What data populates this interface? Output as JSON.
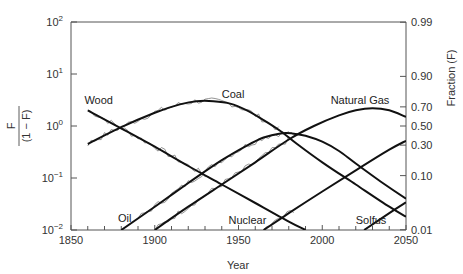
{
  "chart_data": {
    "type": "line",
    "title": "",
    "xlabel": "Year",
    "ylabel_left": "F / (1 − F)",
    "ylabel_right": "Fraction (F)",
    "xlim": [
      1850,
      2050
    ],
    "ylim": [
      0.01,
      100
    ],
    "yscale": "log",
    "grid": false,
    "legend": "inline labels",
    "x_ticks": [
      1850,
      1900,
      1950,
      2000,
      2050
    ],
    "x_minor_step": 10,
    "y_ticks_left": [
      {
        "value": 100,
        "label_base": "10",
        "label_exp": "2"
      },
      {
        "value": 10,
        "label_base": "10",
        "label_exp": "1"
      },
      {
        "value": 1,
        "label_base": "10",
        "label_exp": "0"
      },
      {
        "value": 0.1,
        "label_base": "10",
        "label_exp": "−1"
      },
      {
        "value": 0.01,
        "label_base": "10",
        "label_exp": "−2"
      }
    ],
    "y_ticks_right": [
      {
        "F": 0.99,
        "label": "0.99"
      },
      {
        "F": 0.9,
        "label": "0.90"
      },
      {
        "F": 0.7,
        "label": "0.70"
      },
      {
        "F": 0.5,
        "label": "0.50"
      },
      {
        "F": 0.3,
        "label": "0.30"
      },
      {
        "F": 0.1,
        "label": "0.10"
      },
      {
        "F": 0.01,
        "label": "0.01"
      }
    ],
    "series": [
      {
        "name": "Wood",
        "label": "Wood",
        "label_pos": [
          1858,
          2.6
        ],
        "points": [
          [
            1860,
            2.0
          ],
          [
            1880,
            0.9
          ],
          [
            1900,
            0.4
          ],
          [
            1920,
            0.17
          ],
          [
            1940,
            0.075
          ],
          [
            1960,
            0.033
          ],
          [
            1980,
            0.0145
          ],
          [
            1990,
            0.01
          ]
        ]
      },
      {
        "name": "Coal",
        "label": "Coal",
        "label_pos": [
          1940,
          3.4
        ],
        "points": [
          [
            1860,
            0.45
          ],
          [
            1880,
            0.95
          ],
          [
            1900,
            1.8
          ],
          [
            1915,
            2.6
          ],
          [
            1925,
            3.0
          ],
          [
            1935,
            3.0
          ],
          [
            1945,
            2.7
          ],
          [
            1955,
            2.0
          ],
          [
            1965,
            1.3
          ],
          [
            1975,
            0.8
          ],
          [
            1985,
            0.45
          ],
          [
            2000,
            0.2
          ],
          [
            2020,
            0.075
          ],
          [
            2040,
            0.028
          ],
          [
            2050,
            0.018
          ]
        ]
      },
      {
        "name": "Oil",
        "label": "Oil",
        "label_pos": [
          1878,
          0.014
        ],
        "points": [
          [
            1880,
            0.01
          ],
          [
            1900,
            0.028
          ],
          [
            1920,
            0.08
          ],
          [
            1940,
            0.22
          ],
          [
            1955,
            0.42
          ],
          [
            1965,
            0.6
          ],
          [
            1975,
            0.72
          ],
          [
            1982,
            0.72
          ],
          [
            1990,
            0.65
          ],
          [
            2000,
            0.5
          ],
          [
            2010,
            0.33
          ],
          [
            2020,
            0.19
          ],
          [
            2035,
            0.085
          ],
          [
            2050,
            0.04
          ]
        ]
      },
      {
        "name": "Natural Gas",
        "label": "Natural Gas",
        "label_pos": [
          2005,
          2.6
        ],
        "points": [
          [
            1900,
            0.01
          ],
          [
            1920,
            0.028
          ],
          [
            1940,
            0.075
          ],
          [
            1960,
            0.2
          ],
          [
            1980,
            0.55
          ],
          [
            1995,
            1.0
          ],
          [
            2010,
            1.6
          ],
          [
            2020,
            2.0
          ],
          [
            2030,
            2.2
          ],
          [
            2040,
            2.0
          ],
          [
            2050,
            1.5
          ]
        ]
      },
      {
        "name": "Nuclear",
        "label": "Nuclear",
        "label_pos": [
          1944,
          0.013
        ],
        "points": [
          [
            1965,
            0.01
          ],
          [
            1980,
            0.021
          ],
          [
            2000,
            0.055
          ],
          [
            2020,
            0.14
          ],
          [
            2040,
            0.35
          ],
          [
            2050,
            0.52
          ]
        ]
      },
      {
        "name": "Solfus",
        "label": "Solfus",
        "label_pos": [
          2020,
          0.013
        ],
        "points": [
          [
            2025,
            0.01
          ],
          [
            2040,
            0.021
          ],
          [
            2050,
            0.034
          ]
        ]
      }
    ],
    "historical_data_note": "thin jagged lines trace observed shares around Wood, Coal, Oil, Natural Gas and Nuclear fits"
  }
}
